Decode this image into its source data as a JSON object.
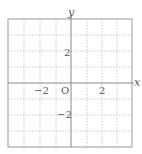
{
  "diagram": {
    "type": "coordinate-grid",
    "x_axis_label": "x",
    "y_axis_label": "y",
    "origin_label": "O",
    "x_tick_labels": [
      {
        "value": -2,
        "label": "−2"
      },
      {
        "value": 2,
        "label": "2"
      }
    ],
    "y_tick_labels": [
      {
        "value": 2,
        "label": "2"
      },
      {
        "value": -2,
        "label": "−2"
      }
    ],
    "x_range": [
      -4,
      4
    ],
    "y_range": [
      -4,
      4
    ],
    "grid": "dotted",
    "colors": {
      "axis": "#888888",
      "grid": "#bbbbbb",
      "frame": "#999999",
      "text": "#555555"
    }
  }
}
